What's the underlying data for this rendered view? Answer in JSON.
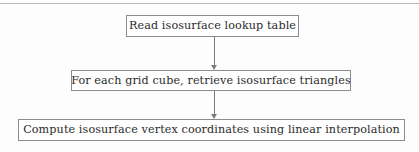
{
  "figure": {
    "type": "flowchart",
    "orientation": "vertical",
    "divider": "top-horizontal-rule",
    "colors": {
      "background": "#fdfdfd",
      "node_fill": "#ffffff",
      "node_border": "#8c8c8c",
      "text": "#2b2b2b",
      "connector": "#7c7c7c",
      "rule": "#b9b9b9"
    }
  },
  "nodes": [
    {
      "id": "read-table",
      "label": "Read isosurface lookup table",
      "step": 1
    },
    {
      "id": "grid-cube",
      "label": "For each grid cube, retrieve isosurface triangles",
      "step": 2
    },
    {
      "id": "interpolate",
      "label": "Compute isosurface vertex coordinates using linear interpolation",
      "step": 3
    }
  ],
  "connectors": [
    {
      "id": "connector-1",
      "from": "read-table",
      "to": "grid-cube",
      "arrowhead": "down-arrow-icon"
    },
    {
      "id": "connector-2",
      "from": "grid-cube",
      "to": "interpolate",
      "arrowhead": "down-arrow-icon"
    }
  ]
}
